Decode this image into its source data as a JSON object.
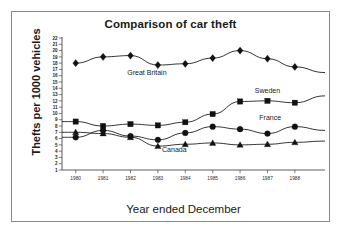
{
  "chart_data": {
    "type": "line",
    "title": "Comparison of car theft",
    "xlabel": "Year ended December",
    "ylabel": "Thefts per 1000 vehicles",
    "categories": [
      "1980",
      "1981",
      "1982",
      "1983",
      "1984",
      "1985",
      "1986",
      "1987",
      "1988"
    ],
    "x": [
      1980,
      1981,
      1982,
      1983,
      1984,
      1985,
      1986,
      1987,
      1988
    ],
    "xlim": [
      1979.5,
      1989.1
    ],
    "ylim": [
      1,
      22
    ],
    "ytick_labels": [
      "22",
      "21",
      "20",
      "19",
      "18",
      "17",
      "16",
      "15",
      "14",
      "13",
      "12",
      "11",
      "10",
      "9",
      "8",
      "7",
      "6",
      "5",
      "4",
      "3",
      "2",
      "1"
    ],
    "yticks": [
      22,
      21,
      20,
      19,
      18,
      17,
      16,
      15,
      14,
      13,
      12,
      11,
      10,
      9,
      8,
      7,
      6,
      5,
      4,
      3,
      2,
      1
    ],
    "grid": false,
    "legend": "inline-annotations",
    "series": [
      {
        "name": "Great Britain",
        "marker": "diamond",
        "color": "#111111",
        "values": [
          18.0,
          19.0,
          19.2,
          17.7,
          17.9,
          18.8,
          20.0,
          18.7,
          17.4
        ],
        "label_x": 1982.6,
        "label_y": 16.1
      },
      {
        "name": "Sweden",
        "marker": "square",
        "color": "#111111",
        "values": [
          8.7,
          8.0,
          8.3,
          8.1,
          8.6,
          9.9,
          11.9,
          12.0,
          11.7
        ],
        "label_x": 1987.0,
        "label_y": 13.3
      },
      {
        "name": "France",
        "marker": "circle",
        "color": "#111111",
        "values": [
          6.2,
          7.3,
          6.4,
          5.8,
          6.9,
          7.9,
          7.5,
          6.8,
          7.9
        ],
        "label_x": 1987.1,
        "label_y": 8.9
      },
      {
        "name": "Canada",
        "marker": "triangle",
        "color": "#111111",
        "values": [
          7.0,
          6.8,
          6.2,
          4.8,
          5.1,
          5.3,
          5.0,
          5.1,
          5.4
        ],
        "label_x": 1983.6,
        "label_y": 3.8
      }
    ],
    "endcap_right": {
      "Great Britain": 16.5,
      "Sweden": 12.8,
      "France": 7.3,
      "Canada": 5.6
    },
    "endcap_left": {
      "Sweden": 8.7,
      "France": 6.2,
      "Canada": 7.0
    }
  }
}
